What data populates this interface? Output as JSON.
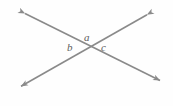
{
  "figure": {
    "name": "intersecting-lines-angle-diagram",
    "background_color": "#fefefe",
    "line_color": "#8a8a8a",
    "label_color": "#5c5c5c",
    "line_width": 1.6,
    "intersection": {
      "x": 89,
      "y": 49
    },
    "lines": [
      {
        "name": "line-ne-sw",
        "description": "double-headed arrow running from upper right to lower left",
        "start": {
          "x": 150,
          "y": 13
        },
        "end": {
          "x": 18,
          "y": 88
        },
        "arrowheads": "both"
      },
      {
        "name": "line-nw-se",
        "description": "double-headed arrow running from upper left to lower right",
        "start": {
          "x": 22,
          "y": 12
        },
        "end": {
          "x": 163,
          "y": 82
        },
        "arrowheads": "both"
      }
    ],
    "labels": [
      {
        "id": "a",
        "text": "a",
        "x": 87,
        "y": 38,
        "position": "above-intersection"
      },
      {
        "id": "b",
        "text": "b",
        "x": 71,
        "y": 48,
        "position": "left-of-intersection"
      },
      {
        "id": "c",
        "text": "c",
        "x": 105,
        "y": 48,
        "position": "right-of-intersection"
      }
    ]
  }
}
